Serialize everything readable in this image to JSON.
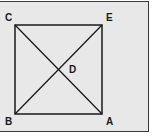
{
  "diagram": {
    "type": "geometry",
    "colors": {
      "background": "#e8e8e8",
      "stroke": "#1a1a1a",
      "frame": "#3a3a3a"
    },
    "points": {
      "A": {
        "label": "A",
        "x": 102,
        "y": 114
      },
      "B": {
        "label": "B",
        "x": 15,
        "y": 114
      },
      "C": {
        "label": "C",
        "x": 15,
        "y": 25
      },
      "E": {
        "label": "E",
        "x": 102,
        "y": 25
      },
      "D": {
        "label": "D",
        "x": 59,
        "y": 69
      }
    },
    "segments": [
      [
        "B",
        "A"
      ],
      [
        "A",
        "E"
      ],
      [
        "E",
        "C"
      ],
      [
        "C",
        "B"
      ],
      [
        "C",
        "A"
      ],
      [
        "B",
        "E"
      ]
    ]
  }
}
